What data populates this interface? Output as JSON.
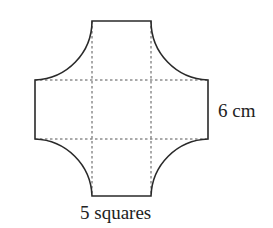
{
  "diagram": {
    "labels": {
      "side": "6 cm",
      "bottom": "5 squares"
    },
    "colors": {
      "outline": "#2a2a2a",
      "dashed_grid": "#555555",
      "text": "#222222"
    }
  }
}
